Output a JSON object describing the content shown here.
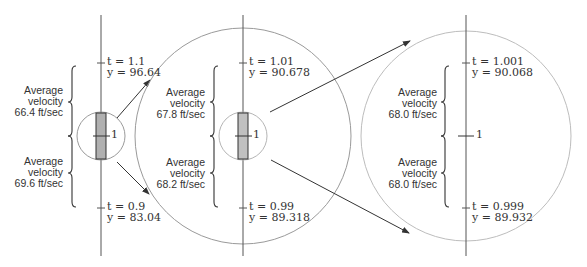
{
  "colors": {
    "axis": "#555555",
    "circle": "#9a9a9a",
    "rect_fill": "#b0b0b0",
    "rect_stroke": "#333333",
    "text": "#333333"
  },
  "panels": [
    {
      "top": {
        "t_label": "t = 1.1",
        "y_label": "y = 96.64"
      },
      "bottom": {
        "t_label": "t = 0.9",
        "y_label": "y = 83.04"
      },
      "upper_velocity": {
        "line1": "Average",
        "line2": "velocity",
        "line3": "66.4 ft/sec"
      },
      "lower_velocity": {
        "line1": "Average",
        "line2": "velocity",
        "line3": "69.6 ft/sec"
      },
      "center_label": "1"
    },
    {
      "top": {
        "t_label": "t = 1.01",
        "y_label": "y = 90.678"
      },
      "bottom": {
        "t_label": "t = 0.99",
        "y_label": "y = 89.318"
      },
      "upper_velocity": {
        "line1": "Average",
        "line2": "velocity",
        "line3": "67.8 ft/sec"
      },
      "lower_velocity": {
        "line1": "Average",
        "line2": "velocity",
        "line3": "68.2 ft/sec"
      },
      "center_label": "1"
    },
    {
      "top": {
        "t_label": "t = 1.001",
        "y_label": "y = 90.068"
      },
      "bottom": {
        "t_label": "t = 0.999",
        "y_label": "y = 89.932"
      },
      "upper_velocity": {
        "line1": "Average",
        "line2": "velocity",
        "line3": "68.0 ft/sec"
      },
      "lower_velocity": {
        "line1": "Average",
        "line2": "velocity",
        "line3": "68.0 ft/sec"
      },
      "center_label": "1"
    }
  ]
}
